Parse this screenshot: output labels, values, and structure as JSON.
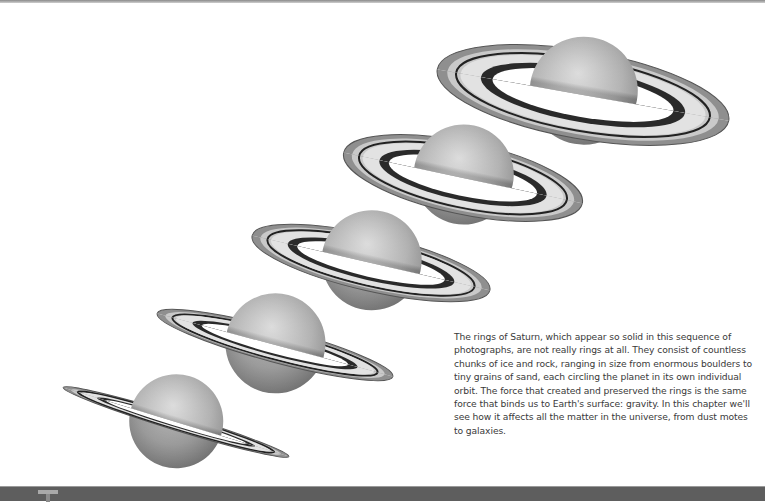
{
  "page": {
    "type": "textbook chapter opener",
    "figure": {
      "subject": "Saturn ring tilt sequence",
      "images": [
        {
          "name": "saturn-1",
          "cx": 583,
          "cy": 95,
          "ring_rx": 148,
          "ring_ry": 44,
          "tilt_deg": 10,
          "planet_r": 54
        },
        {
          "name": "saturn-2",
          "cx": 463,
          "cy": 178,
          "ring_rx": 122,
          "ring_ry": 36,
          "tilt_deg": 12,
          "planet_r": 50
        },
        {
          "name": "saturn-3",
          "cx": 371,
          "cy": 263,
          "ring_rx": 122,
          "ring_ry": 28,
          "tilt_deg": 13,
          "planet_r": 50
        },
        {
          "name": "saturn-4",
          "cx": 275,
          "cy": 345,
          "ring_rx": 122,
          "ring_ry": 17,
          "tilt_deg": 15,
          "planet_r": 50
        },
        {
          "name": "saturn-5",
          "cx": 176,
          "cy": 422,
          "ring_rx": 118,
          "ring_ry": 8,
          "tilt_deg": 17,
          "planet_r": 47
        }
      ]
    },
    "caption": "The rings of Saturn, which appear so solid in this sequence of photographs, are not really rings at all. They consist of countless chunks of ice and rock, ranging in size from enormous boulders to tiny grains of sand, each circling the planet in its own individual orbit. The force that created and preserved the rings is the same force that binds us to Earth's surface: gravity. In this chapter we'll see how it affects all the matter in the universe, from dust motes to galaxies.",
    "footer": {
      "drop_cap_letter": "T",
      "band_color": "#5e5e5e"
    }
  }
}
